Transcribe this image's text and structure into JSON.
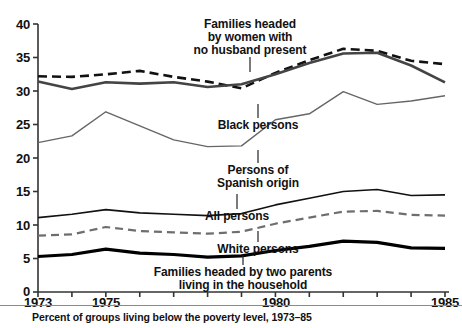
{
  "chart_data": {
    "type": "line",
    "title": "",
    "caption": "Percent of groups living below the poverty level, 1973–85",
    "xlabel": "",
    "ylabel": "",
    "x": [
      1973,
      1974,
      1975,
      1976,
      1977,
      1978,
      1979,
      1980,
      1981,
      1982,
      1983,
      1984,
      1985
    ],
    "xlim": [
      1973,
      1985
    ],
    "ylim": [
      0,
      40
    ],
    "yticks": [
      0,
      5,
      10,
      15,
      20,
      25,
      30,
      35,
      40
    ],
    "xticks_labeled": [
      1973,
      1975,
      1980,
      1985
    ],
    "xticks_all": [
      1973,
      1974,
      1975,
      1976,
      1977,
      1978,
      1979,
      1980,
      1981,
      1982,
      1983,
      1984,
      1985
    ],
    "grid": false,
    "legend": "inline annotations",
    "series": [
      {
        "name": "Families headed by women with no husband present",
        "style": "dashed",
        "color": "#111111",
        "width": 2.6,
        "values": [
          32.2,
          32.1,
          32.5,
          33.0,
          32.1,
          31.4,
          30.4,
          32.7,
          34.6,
          36.3,
          36.0,
          34.5,
          34.0
        ]
      },
      {
        "name": "Black persons",
        "style": "solid",
        "color": "#444444",
        "width": 2.6,
        "values": [
          31.4,
          30.3,
          31.3,
          31.1,
          31.3,
          30.6,
          31.0,
          32.5,
          34.2,
          35.6,
          35.7,
          33.8,
          31.3
        ]
      },
      {
        "name": "Persons of Spanish origin",
        "style": "solid",
        "color": "#666666",
        "width": 1.4,
        "values": [
          22.3,
          23.3,
          26.9,
          24.8,
          22.7,
          21.7,
          21.8,
          25.7,
          26.6,
          29.9,
          28.0,
          28.5,
          29.3
        ]
      },
      {
        "name": "All persons",
        "style": "solid",
        "color": "#111111",
        "width": 1.6,
        "values": [
          11.1,
          11.6,
          12.3,
          11.8,
          11.6,
          11.4,
          11.7,
          13.0,
          14.0,
          15.0,
          15.3,
          14.4,
          14.5
        ]
      },
      {
        "name": "White persons",
        "style": "dashed",
        "color": "#6e6e6e",
        "width": 2.2,
        "values": [
          8.4,
          8.6,
          9.7,
          9.1,
          8.9,
          8.7,
          9.0,
          10.2,
          11.1,
          12.0,
          12.1,
          11.5,
          11.4
        ]
      },
      {
        "name": "Families headed by two parents living in the household",
        "style": "solid",
        "color": "#000000",
        "width": 3.2,
        "values": [
          5.3,
          5.6,
          6.4,
          5.8,
          5.6,
          5.2,
          5.4,
          6.2,
          6.8,
          7.6,
          7.4,
          6.6,
          6.5
        ]
      }
    ]
  },
  "axis": {
    "y_tick_labels": [
      "40",
      "35",
      "30",
      "25",
      "20",
      "15",
      "10",
      "5",
      "0"
    ],
    "x_tick_labels": [
      "1973",
      "1975",
      "1980",
      "1985"
    ]
  },
  "annotations": {
    "women_no_husband": "Families headed\nby women with\nno husband present",
    "black_persons": "Black persons",
    "spanish_origin": "Persons of\nSpanish origin",
    "all_persons": "All persons",
    "white_persons": "White persons",
    "two_parents": "Families headed by two parents\nliving in the household"
  },
  "caption": {
    "text": "Percent of groups living below the poverty level, 1973–85"
  }
}
